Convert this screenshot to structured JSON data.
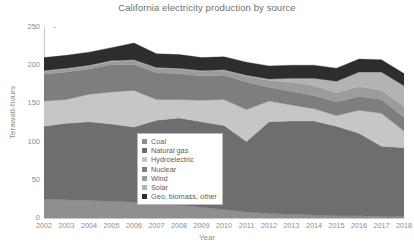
{
  "chart_data": {
    "type": "area",
    "stacked": true,
    "title": "California electricity production by source",
    "xlabel": "Year",
    "ylabel": "Terawatt-hours",
    "x": [
      2002,
      2003,
      2004,
      2005,
      2006,
      2007,
      2008,
      2009,
      2010,
      2011,
      2012,
      2013,
      2014,
      2015,
      2016,
      2017,
      2018
    ],
    "xlim": [
      2002,
      2018
    ],
    "ylim": [
      0,
      250
    ],
    "yticks": [
      0,
      50,
      100,
      150,
      200,
      250
    ],
    "grid": false,
    "legend_position": "center",
    "series": [
      {
        "name": "Coal",
        "color": "#8f8f8f",
        "values": [
          25,
          24,
          23,
          22,
          21,
          18,
          17,
          14,
          11,
          8,
          6,
          5,
          4,
          3,
          3,
          2,
          2
        ]
      },
      {
        "name": "Natural gas",
        "color": "#6e6e6e",
        "values": [
          95,
          100,
          103,
          101,
          98,
          110,
          114,
          112,
          110,
          92,
          120,
          122,
          123,
          117,
          108,
          92,
          90
        ]
      },
      {
        "name": "Hydroelectric",
        "color": "#c6c6c6",
        "values": [
          33,
          31,
          36,
          42,
          48,
          27,
          24,
          28,
          34,
          42,
          27,
          21,
          16,
          14,
          30,
          43,
          22
        ]
      },
      {
        "name": "Nuclear",
        "color": "#7e7e7e",
        "values": [
          35,
          36,
          33,
          36,
          34,
          35,
          34,
          32,
          32,
          36,
          18,
          18,
          17,
          18,
          18,
          18,
          18
        ]
      },
      {
        "name": "Wind",
        "color": "#9c9c9c",
        "values": [
          4,
          4,
          4,
          4,
          5,
          6,
          6,
          6,
          6,
          8,
          9,
          12,
          13,
          12,
          13,
          12,
          14
        ]
      },
      {
        "name": "Solar",
        "color": "#b3b3b3",
        "values": [
          1,
          1,
          1,
          1,
          1,
          1,
          1,
          1,
          1,
          1,
          2,
          5,
          10,
          15,
          19,
          24,
          27
        ]
      },
      {
        "name": "Geo, biomass, other",
        "color": "#2d2d2d",
        "values": [
          17,
          17,
          17,
          17,
          22,
          18,
          18,
          17,
          17,
          17,
          17,
          17,
          17,
          17,
          17,
          16,
          16
        ]
      }
    ]
  },
  "legend": {
    "items": [
      {
        "label": "Coal",
        "color": "#8f8f8f"
      },
      {
        "label": "Natural gas",
        "color": "#6e6e6e"
      },
      {
        "label": "Hydroelectric",
        "color": "#c6c6c6"
      },
      {
        "label": "Nuclear",
        "color": "#7e7e7e"
      },
      {
        "label": "Wind",
        "color": "#9c9c9c"
      },
      {
        "label": "Solar",
        "color": "#b3b3b3"
      },
      {
        "label": "Geo, biomass, other",
        "color": "#2d2d2d"
      }
    ]
  }
}
